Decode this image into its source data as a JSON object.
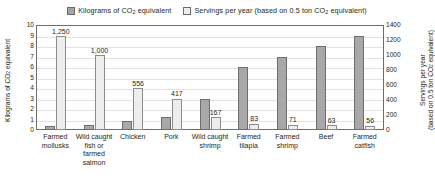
{
  "chart_data": {
    "type": "bar",
    "title": "",
    "categories": [
      "Farmed mollusks",
      "Wild caught fish or farmed salmon",
      "Chicken",
      "Pork",
      "Wild caught shrimp",
      "Farmed tilapia",
      "Farmed shrimp",
      "Beef",
      "Farmed catfish"
    ],
    "series": [
      {
        "name": "Kilograms of CO2 equivalent",
        "axis": "left",
        "color": "#a8a8a8",
        "values": [
          0.4,
          0.5,
          0.9,
          1.2,
          3.0,
          6.0,
          7.0,
          8.0,
          9.0
        ]
      },
      {
        "name": "Servings per year (based on 0.5 ton CO2 equivalent)",
        "axis": "right",
        "color": "#ededed",
        "values": [
          1250,
          1000,
          556,
          417,
          167,
          83,
          71,
          63,
          56
        ],
        "data_labels": [
          "1,250",
          "1,000",
          "556",
          "417",
          "167",
          "83",
          "71",
          "63",
          "56"
        ]
      }
    ],
    "xlabel": "",
    "ylabel_left": "Kilograms of CO2 equivalent",
    "ylabel_right": "Servings per year (based on 0.5 ton CO2 equivalent)",
    "ylim_left": [
      0,
      10
    ],
    "ylim_right": [
      0,
      1400
    ],
    "yticks_left": [
      "10",
      "9",
      "8",
      "7",
      "6",
      "5",
      "4",
      "3",
      "2",
      "1",
      "0"
    ],
    "yticks_right": [
      "1400",
      "1200",
      "1000",
      "800",
      "600",
      "400",
      "200",
      "0"
    ],
    "grid": true,
    "legend_position": "top"
  },
  "legend": {
    "items": [
      {
        "label_pre": "Kilograms of CO",
        "sub": "2",
        "label_post": " equivalent",
        "swatch": "dark"
      },
      {
        "label_pre": "Servings per year (based on 0.5 ton CO",
        "sub": "2",
        "label_post": " equivalent)",
        "swatch": "light"
      }
    ]
  },
  "axis_titles": {
    "left_pre": "Kilograms of CO",
    "left_sub": "2",
    "left_post": " equivalent",
    "right_line1_pre": "Servings per year",
    "right_line2_pre": "(based on 0.5 ton CO",
    "right_sub": "2",
    "right_line2_post": " equivalent)"
  }
}
